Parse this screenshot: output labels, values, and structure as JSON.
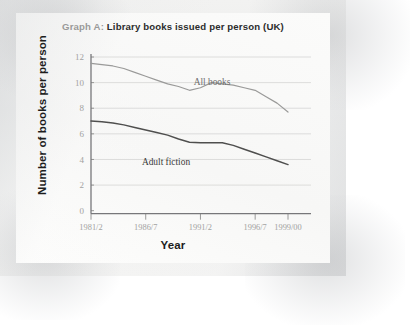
{
  "figure": {
    "title_prefix": "Graph A:",
    "title_main": "Library books issued per person (UK)",
    "y_axis_title": "Number of books per person",
    "x_axis_title": "Year"
  },
  "chart_data": {
    "type": "line",
    "title": "Graph A: Library books issued per person (UK)",
    "xlabel": "Year",
    "ylabel": "Number of books per person",
    "ylim": [
      0,
      12
    ],
    "yticks": [
      0,
      2,
      4,
      6,
      8,
      10,
      12
    ],
    "ytick_labels": [
      "0",
      "2",
      "4",
      "6",
      "8",
      "10",
      "12"
    ],
    "xticks": [
      "1981/2",
      "1986/7",
      "1991/2",
      "1996/7",
      "1999/00"
    ],
    "xtick_labels": [
      "1981/2",
      "1986/7",
      "1991/2",
      "1996/7",
      "1999/00"
    ],
    "x": [
      "1981/2",
      "1982/3",
      "1983/4",
      "1984/5",
      "1985/6",
      "1986/7",
      "1987/8",
      "1988/9",
      "1989/90",
      "1990/1",
      "1991/2",
      "1992/3",
      "1993/4",
      "1994/5",
      "1995/6",
      "1996/7",
      "1997/8",
      "1998/9",
      "1999/00"
    ],
    "grid": "horizontal",
    "legend": "inline-labels",
    "series": [
      {
        "name": "All books",
        "color": "#9a9a99",
        "values": [
          11.5,
          11.4,
          11.3,
          11.1,
          10.8,
          10.5,
          10.2,
          9.9,
          9.7,
          9.4,
          9.6,
          10.0,
          9.9,
          9.8,
          9.6,
          9.4,
          8.9,
          8.4,
          7.7
        ]
      },
      {
        "name": "Adult fiction",
        "color": "#4f4f4e",
        "values": [
          7.0,
          6.95,
          6.85,
          6.7,
          6.5,
          6.3,
          6.1,
          5.9,
          5.6,
          5.35,
          5.3,
          5.3,
          5.3,
          5.1,
          4.8,
          4.5,
          4.2,
          3.9,
          3.6
        ]
      }
    ],
    "annotations": [
      {
        "text": "All books",
        "series": "All books"
      },
      {
        "text": "Adult fiction",
        "series": "Adult fiction"
      }
    ]
  }
}
